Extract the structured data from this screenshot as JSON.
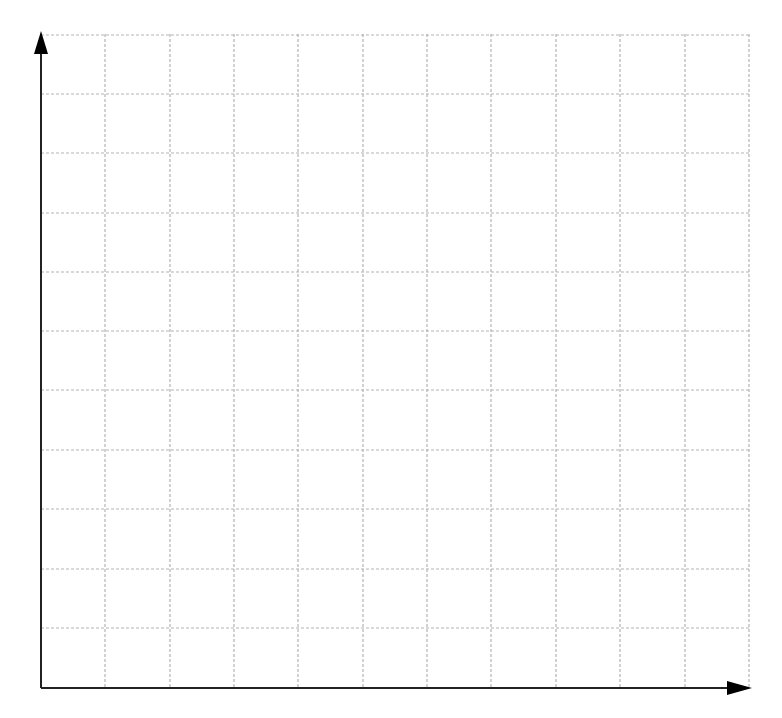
{
  "diagram": {
    "type": "blank-coordinate-grid",
    "origin": [
      41,
      688
    ],
    "x_axis": {
      "end": 752,
      "arrow": true,
      "color": "#222222"
    },
    "y_axis": {
      "end": 31,
      "arrow": true,
      "color": "#222222"
    },
    "grid": {
      "columns": 11,
      "rows": 11,
      "x_lines": [
        105,
        170,
        234,
        298,
        363,
        427,
        491,
        556,
        620,
        685,
        749
      ],
      "y_lines": [
        35,
        94,
        153,
        213,
        272,
        331,
        390,
        450,
        509,
        569,
        628
      ],
      "line_color": "#b4b4b4",
      "dash": "3,2"
    },
    "labels": []
  }
}
